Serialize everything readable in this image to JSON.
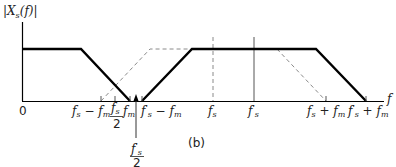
{
  "diagram": {
    "y_axis_label": "|X_s(f)|",
    "y_axis_label_parts": {
      "open": "|",
      "X": "X",
      "sub": "s",
      "rest": "(f)",
      "close": "|"
    },
    "x_axis_label": "f",
    "origin_label": "0",
    "panel_label": "(b)",
    "colors": {
      "solid": "#000000",
      "dashed": "#8a8a8a",
      "axis": "#000000"
    },
    "tick_labels": {
      "fs_minus_fm": "f_s − f_m",
      "fs_over_2": "f_s / 2",
      "fm": "f_m",
      "fps_over_2": "f'_s / 2",
      "fps_minus_fm": "f'_s − f_m",
      "fs": "f_s",
      "fps": "f'_s",
      "fs_plus_fm": "f_s + f_m",
      "fps_plus_fm": "f'_s + f_m"
    },
    "text": {
      "f": "f",
      "s": "s",
      "m": "m",
      "prime": "'",
      "minus": " − ",
      "plus": " + ",
      "two": "2"
    },
    "spectra": [
      {
        "name": "baseband",
        "style": "solid",
        "points": [
          [
            0,
            1
          ],
          [
            81,
            1
          ],
          [
            130,
            0
          ]
        ]
      },
      {
        "name": "image-at-f'_s",
        "style": "solid",
        "points": [
          [
            142,
            0
          ],
          [
            192,
            1
          ],
          [
            316,
            1
          ],
          [
            366,
            0
          ]
        ]
      },
      {
        "name": "image-at-f_s",
        "style": "dashed",
        "points": [
          [
            101,
            0
          ],
          [
            150,
            1
          ],
          [
            277,
            1
          ],
          [
            326,
            0
          ]
        ]
      }
    ]
  }
}
